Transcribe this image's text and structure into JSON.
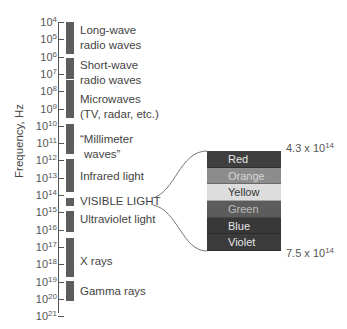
{
  "chart_data": {
    "type": "diagram",
    "ylabel": "Frequency, Hz",
    "axis": {
      "scale": "log10",
      "range_exponents": [
        4,
        21
      ],
      "tick_labels": [
        "10^4",
        "10^5",
        "10^6",
        "10^7",
        "10^8",
        "10^9",
        "10^10",
        "10^11",
        "10^12",
        "10^13",
        "10^14",
        "10^15",
        "10^16",
        "10^17",
        "10^18",
        "10^19",
        "10^20",
        "10^21"
      ]
    },
    "regions": [
      {
        "name": "Long-wave radio waves",
        "from_exp": 4,
        "to_exp": 6
      },
      {
        "name": "Short-wave radio waves",
        "from_exp": 6.2,
        "to_exp": 7.5
      },
      {
        "name": "Microwaves (TV, radar, etc.)",
        "from_exp": 7.5,
        "to_exp": 10
      },
      {
        "name": "\"Millimeter waves\"",
        "from_exp": 10.1,
        "to_exp": 11.8
      },
      {
        "name": "Infrared light",
        "from_exp": 12.1,
        "to_exp": 14.1
      },
      {
        "name": "VISIBLE LIGHT",
        "from_exp": 14.4,
        "to_exp": 14.9
      },
      {
        "name": "Ultraviolet light",
        "from_exp": 15.1,
        "to_exp": 16.3
      },
      {
        "name": "X rays",
        "from_exp": 16.6,
        "to_exp": 19
      },
      {
        "name": "Gamma rays",
        "from_exp": 19.2,
        "to_exp": 20.4
      }
    ],
    "visible_spectrum": {
      "colors": [
        "Red",
        "Orange",
        "Yellow",
        "Green",
        "Blue",
        "Violet"
      ],
      "low_frequency": "4.3 x 10^14",
      "high_frequency": "7.5 x 10^14"
    }
  },
  "ylabel": "Frequency, Hz",
  "ticks": [
    {
      "base": "10",
      "exp": "4"
    },
    {
      "base": "10",
      "exp": "5"
    },
    {
      "base": "10",
      "exp": "6"
    },
    {
      "base": "10",
      "exp": "7"
    },
    {
      "base": "10",
      "exp": "8"
    },
    {
      "base": "10",
      "exp": "9"
    },
    {
      "base": "10",
      "exp": "10"
    },
    {
      "base": "10",
      "exp": "11"
    },
    {
      "base": "10",
      "exp": "12"
    },
    {
      "base": "10",
      "exp": "13"
    },
    {
      "base": "10",
      "exp": "14"
    },
    {
      "base": "10",
      "exp": "15"
    },
    {
      "base": "10",
      "exp": "16"
    },
    {
      "base": "10",
      "exp": "17"
    },
    {
      "base": "10",
      "exp": "18"
    },
    {
      "base": "10",
      "exp": "19"
    },
    {
      "base": "10",
      "exp": "20"
    },
    {
      "base": "10",
      "exp": "21"
    }
  ],
  "regions": [
    {
      "line1": "Long-wave",
      "line2": "radio waves"
    },
    {
      "line1": "Short-wave",
      "line2": "radio waves"
    },
    {
      "line1": "Microwaves",
      "line2": "(TV, radar, etc.)"
    },
    {
      "line1": "“Millimeter",
      "line2": "waves”"
    },
    {
      "line1": "Infrared light"
    },
    {
      "line1": "VISIBLE LIGHT"
    },
    {
      "line1": "Ultraviolet light"
    },
    {
      "line1": "X rays"
    },
    {
      "line1": "Gamma rays"
    }
  ],
  "spectrum": {
    "bands": [
      {
        "label": "Red",
        "bg": "#3f3f3f",
        "fg": "#e6e6e6"
      },
      {
        "label": "Orange",
        "bg": "#8c8c8c",
        "fg": "#d6d6d6"
      },
      {
        "label": "Yellow",
        "bg": "#dddddd",
        "fg": "#333333"
      },
      {
        "label": "Green",
        "bg": "#5c5c5c",
        "fg": "#bdbdbd"
      },
      {
        "label": "Blue",
        "bg": "#383838",
        "fg": "#e6e6e6"
      },
      {
        "label": "Violet",
        "bg": "#3b3b3b",
        "fg": "#e6e6e6"
      }
    ],
    "top_label": {
      "mantissa": "4.3 x 10",
      "exp": "14"
    },
    "bottom_label": {
      "mantissa": "7.5 x 10",
      "exp": "14"
    }
  }
}
